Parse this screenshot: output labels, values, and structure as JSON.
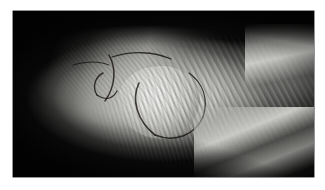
{
  "page": {
    "background_color": "#ffffff",
    "width": 325,
    "height": 190
  },
  "figure": {
    "name": "clinical-photograph",
    "kind": "photograph",
    "frame": {
      "left": 13,
      "top": 11,
      "width": 301,
      "height": 166,
      "background_color": "#050505",
      "border_color": "#2a2a2a"
    },
    "lighting": {
      "description": "strong directional light from upper-left against a black background",
      "highlight_color": "#f2f2f0",
      "midtone_color": "#c6c6c2",
      "shadow_color": "#050505"
    },
    "regions": [
      {
        "name": "background",
        "label": "black backdrop",
        "color": "#050505"
      },
      {
        "name": "limb-mass",
        "label": "lit body of the wrapped limb",
        "color": "#c6c6c2"
      },
      {
        "name": "distal-bulb",
        "label": "bright rounded distal end of the dressing",
        "color": "#f2f2f0"
      },
      {
        "name": "bandage-wrap",
        "label": "diagonal ridged bandage striations",
        "color": "#a8a8a4"
      },
      {
        "name": "surgical-markings",
        "label": "dark curved suture / ink lines",
        "color": "#15100e"
      },
      {
        "name": "drape",
        "label": "pale sheet and drape folds at lower right",
        "color": "#dedeDA"
      }
    ]
  },
  "caption": {
    "text": "",
    "legible": false,
    "note": "caption text below the photograph is too degraded to read"
  }
}
